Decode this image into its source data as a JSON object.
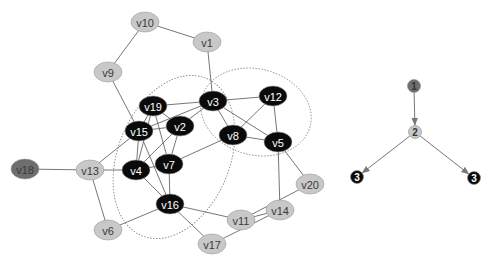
{
  "colors": {
    "black_node": "#0a0a0a",
    "gray_node": "#c8c8c8",
    "dark_gray_node": "#6e6e6e",
    "edge": "#666666",
    "cluster_outline": "#8a8a8a"
  },
  "main_graph": {
    "nodes": [
      {
        "id": "v10",
        "label": "v10",
        "x": 145,
        "y": 22,
        "fill": "gray"
      },
      {
        "id": "v1",
        "label": "v1",
        "x": 207,
        "y": 42,
        "fill": "gray"
      },
      {
        "id": "v9",
        "label": "v9",
        "x": 108,
        "y": 72,
        "fill": "gray"
      },
      {
        "id": "v19",
        "label": "v19",
        "x": 153,
        "y": 106,
        "fill": "black"
      },
      {
        "id": "v3",
        "label": "v3",
        "x": 213,
        "y": 101,
        "fill": "black"
      },
      {
        "id": "v12",
        "label": "v12",
        "x": 273,
        "y": 96,
        "fill": "black"
      },
      {
        "id": "v2",
        "label": "v2",
        "x": 180,
        "y": 126,
        "fill": "black"
      },
      {
        "id": "v15",
        "label": "v15",
        "x": 139,
        "y": 131,
        "fill": "black"
      },
      {
        "id": "v8",
        "label": "v8",
        "x": 233,
        "y": 135,
        "fill": "black"
      },
      {
        "id": "v5",
        "label": "v5",
        "x": 278,
        "y": 142,
        "fill": "black"
      },
      {
        "id": "v7",
        "label": "v7",
        "x": 169,
        "y": 164,
        "fill": "black"
      },
      {
        "id": "v4",
        "label": "v4",
        "x": 136,
        "y": 170,
        "fill": "black"
      },
      {
        "id": "v13",
        "label": "v13",
        "x": 90,
        "y": 170,
        "fill": "gray"
      },
      {
        "id": "v18",
        "label": "v18",
        "x": 25,
        "y": 169,
        "fill": "dark_gray"
      },
      {
        "id": "v16",
        "label": "v16",
        "x": 170,
        "y": 204,
        "fill": "black"
      },
      {
        "id": "v20",
        "label": "v20",
        "x": 310,
        "y": 184,
        "fill": "gray"
      },
      {
        "id": "v14",
        "label": "v14",
        "x": 280,
        "y": 210,
        "fill": "gray"
      },
      {
        "id": "v11",
        "label": "v11",
        "x": 241,
        "y": 220,
        "fill": "gray"
      },
      {
        "id": "v6",
        "label": "v6",
        "x": 108,
        "y": 230,
        "fill": "gray"
      },
      {
        "id": "v17",
        "label": "v17",
        "x": 212,
        "y": 244,
        "fill": "gray"
      }
    ],
    "edges": [
      [
        "v10",
        "v1"
      ],
      [
        "v10",
        "v9"
      ],
      [
        "v1",
        "v3"
      ],
      [
        "v9",
        "v15"
      ],
      [
        "v19",
        "v3"
      ],
      [
        "v19",
        "v2"
      ],
      [
        "v19",
        "v15"
      ],
      [
        "v19",
        "v4"
      ],
      [
        "v19",
        "v7"
      ],
      [
        "v3",
        "v12"
      ],
      [
        "v3",
        "v15"
      ],
      [
        "v3",
        "v2"
      ],
      [
        "v3",
        "v8"
      ],
      [
        "v3",
        "v5"
      ],
      [
        "v12",
        "v8"
      ],
      [
        "v12",
        "v5"
      ],
      [
        "v8",
        "v5"
      ],
      [
        "v8",
        "v7"
      ],
      [
        "v15",
        "v2"
      ],
      [
        "v15",
        "v4"
      ],
      [
        "v15",
        "v13"
      ],
      [
        "v15",
        "v16"
      ],
      [
        "v2",
        "v7"
      ],
      [
        "v2",
        "v4"
      ],
      [
        "v4",
        "v7"
      ],
      [
        "v4",
        "v13"
      ],
      [
        "v4",
        "v16"
      ],
      [
        "v7",
        "v16"
      ],
      [
        "v13",
        "v18"
      ],
      [
        "v13",
        "v6"
      ],
      [
        "v6",
        "v16"
      ],
      [
        "v16",
        "v11"
      ],
      [
        "v16",
        "v17"
      ],
      [
        "v5",
        "v14"
      ],
      [
        "v5",
        "v20"
      ],
      [
        "v20",
        "v11"
      ],
      [
        "v11",
        "v14"
      ],
      [
        "v14",
        "v17"
      ]
    ],
    "clusters": [
      {
        "cx": 174,
        "cy": 157,
        "rx": 56,
        "ry": 85,
        "rotate": 22
      },
      {
        "cx": 256,
        "cy": 112,
        "rx": 56,
        "ry": 43,
        "rotate": 15
      }
    ]
  },
  "legend_graph": {
    "nodes": [
      {
        "id": "n1",
        "label": "1",
        "x": 414,
        "y": 86,
        "fill": "dark_gray"
      },
      {
        "id": "n2",
        "label": "2",
        "x": 415,
        "y": 132,
        "fill": "gray"
      },
      {
        "id": "n3a",
        "label": "3",
        "x": 357,
        "y": 177,
        "fill": "black"
      },
      {
        "id": "n3b",
        "label": "3",
        "x": 474,
        "y": 178,
        "fill": "black"
      }
    ],
    "edges": [
      [
        "n1",
        "n2"
      ],
      [
        "n2",
        "n3a"
      ],
      [
        "n2",
        "n3b"
      ]
    ]
  }
}
